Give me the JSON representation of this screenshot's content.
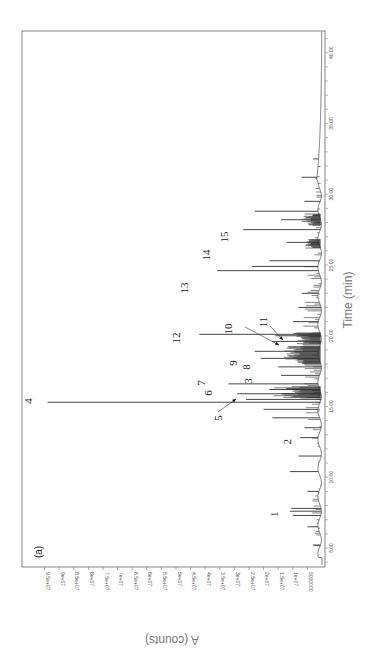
{
  "chart_data": {
    "type": "line",
    "orientation": "rotated-90-ccw",
    "title": "",
    "panel_label": "(a)",
    "xlabel": "Time (min)",
    "ylabel": "A (counts)",
    "xlim": [
      3.5,
      42
    ],
    "ylim": [
      0,
      97000000
    ],
    "x_ticks": [
      {
        "value": 5,
        "label": "5.00"
      },
      {
        "value": 10,
        "label": "10.00"
      },
      {
        "value": 15,
        "label": "15.00"
      },
      {
        "value": 20,
        "label": "20.00"
      },
      {
        "value": 25,
        "label": "25.00"
      },
      {
        "value": 30,
        "label": "30.00"
      },
      {
        "value": 35,
        "label": "35.00"
      },
      {
        "value": 40,
        "label": "40.00"
      }
    ],
    "y_ticks": [
      {
        "value": 5000000,
        "label": "5000000"
      },
      {
        "value": 10000000,
        "label": "1e+07"
      },
      {
        "value": 15000000,
        "label": "1.5e+07"
      },
      {
        "value": 20000000,
        "label": "2e+07"
      },
      {
        "value": 25000000,
        "label": "2.5e+07"
      },
      {
        "value": 30000000,
        "label": "3e+07"
      },
      {
        "value": 35000000,
        "label": "3.5e+07"
      },
      {
        "value": 40000000,
        "label": "4e+07"
      },
      {
        "value": 45000000,
        "label": "4.5e+07"
      },
      {
        "value": 50000000,
        "label": "5e+07"
      },
      {
        "value": 55000000,
        "label": "5.5e+07"
      },
      {
        "value": 60000000,
        "label": "6e+07"
      },
      {
        "value": 65000000,
        "label": "6.5e+07"
      },
      {
        "value": 70000000,
        "label": "7e+07"
      },
      {
        "value": 75000000,
        "label": "7.5e+07"
      },
      {
        "value": 80000000,
        "label": "8e+07"
      },
      {
        "value": 85000000,
        "label": "8.5e+07"
      },
      {
        "value": 90000000,
        "label": "9e+07"
      },
      {
        "value": 95000000,
        "label": "9.5e+07"
      }
    ],
    "labeled_peaks": [
      {
        "label": "1",
        "time": 7.6,
        "counts": 11000000
      },
      {
        "label": "2",
        "time": 12.8,
        "counts": 7500000
      },
      {
        "label": "3",
        "time": 14.2,
        "counts": 17000000
      },
      {
        "label": "4",
        "time": 15.3,
        "counts": 94000000
      },
      {
        "label": "5",
        "time": 15.5,
        "counts": 26000000
      },
      {
        "label": "6",
        "time": 15.9,
        "counts": 29000000
      },
      {
        "label": "7",
        "time": 16.6,
        "counts": 32000000
      },
      {
        "label": "8",
        "time": 18.4,
        "counts": 21000000
      },
      {
        "label": "9",
        "time": 18.9,
        "counts": 23000000
      },
      {
        "label": "10",
        "time": 19.6,
        "counts": 17000000
      },
      {
        "label": "11",
        "time": 20.0,
        "counts": 16000000
      },
      {
        "label": "12",
        "time": 20.1,
        "counts": 42000000
      },
      {
        "label": "13",
        "time": 24.6,
        "counts": 36000000
      },
      {
        "label": "14",
        "time": 27.5,
        "counts": 27000000
      },
      {
        "label": "15",
        "time": 28.8,
        "counts": 23000000
      }
    ],
    "other_peaks": [
      {
        "time": 5.2,
        "counts": 3000000
      },
      {
        "time": 6.5,
        "counts": 5000000
      },
      {
        "time": 7.3,
        "counts": 10000000
      },
      {
        "time": 7.8,
        "counts": 10500000
      },
      {
        "time": 9.0,
        "counts": 5000000
      },
      {
        "time": 10.4,
        "counts": 11000000
      },
      {
        "time": 11.5,
        "counts": 8000000
      },
      {
        "time": 13.5,
        "counts": 6000000
      },
      {
        "time": 14.8,
        "counts": 20000000
      },
      {
        "time": 16.2,
        "counts": 18000000
      },
      {
        "time": 17.2,
        "counts": 14000000
      },
      {
        "time": 17.8,
        "counts": 15000000
      },
      {
        "time": 21.0,
        "counts": 10000000
      },
      {
        "time": 22.0,
        "counts": 8000000
      },
      {
        "time": 23.0,
        "counts": 7000000
      },
      {
        "time": 24.9,
        "counts": 24000000
      },
      {
        "time": 25.3,
        "counts": 18000000
      },
      {
        "time": 26.6,
        "counts": 12000000
      },
      {
        "time": 28.2,
        "counts": 14000000
      },
      {
        "time": 29.5,
        "counts": 6000000
      },
      {
        "time": 31.2,
        "counts": 7000000
      },
      {
        "time": 32.5,
        "counts": 3000000
      }
    ],
    "grid": false,
    "legend": "none"
  }
}
